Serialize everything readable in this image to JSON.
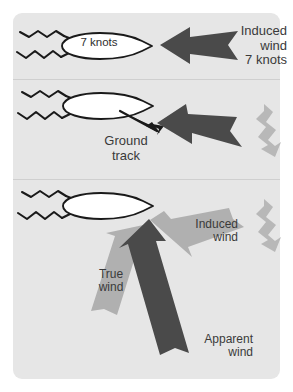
{
  "figure": {
    "background_color": "#ffffff",
    "panel_color": "#e6e6e6",
    "divider_color": "#cfcfcf",
    "dark_arrow_color": "#4a4a4a",
    "gray_arrow_color": "#b0b0b0",
    "hull_fill": "#ffffff",
    "outline_color": "#1a1a1a",
    "text_color": "#3a3a3a"
  },
  "panels": [
    {
      "id": "panel-1",
      "boat_label": "7 knots",
      "arrow_label": "Induced\nwind\n7 knots",
      "arrow_label_lines": [
        "Induced",
        "wind",
        "7 knots"
      ],
      "arrow_color": "#4a4a4a",
      "arrow_direction": "left",
      "arrow_name": "induced-wind-arrow",
      "wave_lines": 2,
      "true_wind_zigzag": false
    },
    {
      "id": "panel-2",
      "boat_label": "",
      "arrow_label": "Ground\ntrack",
      "arrow_label_lines": [
        "Ground",
        "track"
      ],
      "arrow_color": "#4a4a4a",
      "arrow_direction": "left-down",
      "arrow_name": "induced-wind-arrow",
      "wave_lines": 2,
      "true_wind_zigzag": true,
      "zigzag_direction": "down"
    },
    {
      "id": "panel-3",
      "boat_label": "",
      "arrows": [
        {
          "name": "induced-wind-arrow",
          "label_lines": [
            "Induced",
            "wind"
          ],
          "color": "#b0b0b0",
          "direction": "up-left"
        },
        {
          "name": "true-wind-arrow",
          "label_lines": [
            "True",
            "wind"
          ],
          "color": "#b0b0b0",
          "direction": "up-right"
        },
        {
          "name": "apparent-wind-arrow",
          "label_lines": [
            "Apparent",
            "wind"
          ],
          "color": "#4a4a4a",
          "direction": "up"
        }
      ],
      "wave_lines": 2,
      "true_wind_zigzag": true,
      "zigzag_direction": "down"
    }
  ],
  "labels": {
    "boat_speed": "7 knots",
    "induced_wind_1": "Induced\nwind\n7 knots",
    "ground_track": "Ground\ntrack",
    "induced_wind_2": "Induced\nwind",
    "true_wind": "True\nwind",
    "apparent_wind": "Apparent\nwind"
  }
}
